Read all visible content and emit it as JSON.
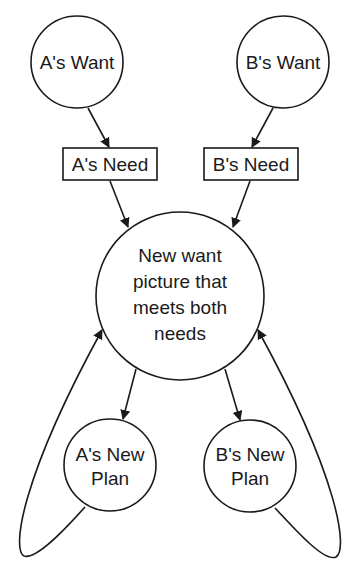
{
  "diagram": {
    "nodes": {
      "a_want": {
        "label": "A's Want",
        "shape": "circle"
      },
      "b_want": {
        "label": "B's Want",
        "shape": "circle"
      },
      "a_need": {
        "label": "A's Need",
        "shape": "box"
      },
      "b_need": {
        "label": "B's Need",
        "shape": "box"
      },
      "new_want": {
        "lines": [
          "New want",
          "picture that",
          "meets both",
          "needs"
        ],
        "shape": "circle"
      },
      "a_plan": {
        "lines": [
          "A's New",
          "Plan"
        ],
        "shape": "circle"
      },
      "b_plan": {
        "lines": [
          "B's New",
          "Plan"
        ],
        "shape": "circle"
      }
    },
    "edges": [
      {
        "from": "A's Want",
        "to": "A's Need"
      },
      {
        "from": "B's Want",
        "to": "B's Need"
      },
      {
        "from": "A's Need",
        "to": "New want picture that meets both needs"
      },
      {
        "from": "B's Need",
        "to": "New want picture that meets both needs"
      },
      {
        "from": "New want picture that meets both needs",
        "to": "A's New Plan"
      },
      {
        "from": "New want picture that meets both needs",
        "to": "B's New Plan"
      },
      {
        "from": "A's New Plan",
        "to": "New want picture that meets both needs",
        "style": "loop"
      },
      {
        "from": "B's New Plan",
        "to": "New want picture that meets both needs",
        "style": "loop"
      }
    ],
    "colors": {
      "stroke": "#1a1a1a",
      "background": "#ffffff"
    }
  }
}
